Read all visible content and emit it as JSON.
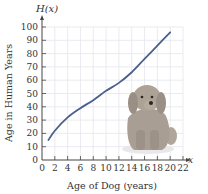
{
  "chart_data": {
    "type": "line",
    "title": "",
    "function_label": "H(x)",
    "x_axis_symbol": "x",
    "xlabel": "Age of Dog (years)",
    "ylabel": "Age in Human Years",
    "xlim": [
      0,
      22
    ],
    "ylim": [
      0,
      100
    ],
    "x_ticks": [
      0,
      2,
      4,
      6,
      8,
      10,
      12,
      14,
      16,
      18,
      20,
      22
    ],
    "y_ticks": [
      0,
      10,
      20,
      30,
      40,
      50,
      60,
      70,
      80,
      90,
      100
    ],
    "grid": true,
    "series": [
      {
        "name": "H(x)",
        "color": "#4a5f8a",
        "x": [
          1,
          2,
          4,
          6,
          8,
          10,
          12,
          14,
          16,
          18,
          20
        ],
        "y": [
          15,
          22,
          32,
          39,
          45,
          52,
          58,
          66,
          76,
          86,
          96
        ]
      }
    ],
    "annotations": [
      "dog illustration (seated poodle) inside plot area"
    ]
  },
  "colors": {
    "curve": "#4a5f8a",
    "grid": "#e4e6ee",
    "axis": "#444444",
    "dog_body": "#a89d92",
    "dog_shadow": "#8b8077"
  }
}
